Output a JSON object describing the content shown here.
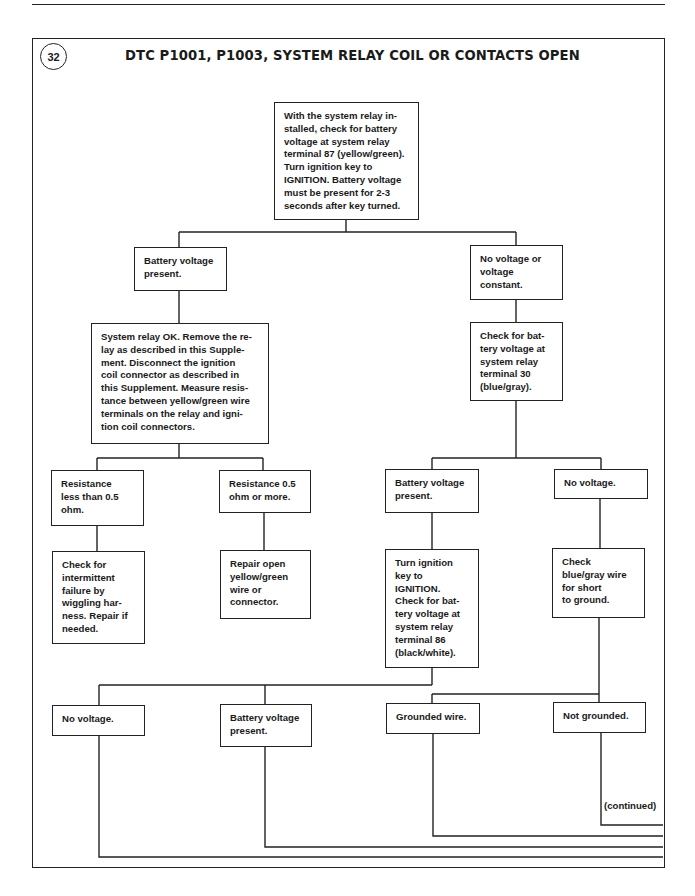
{
  "page": {
    "header_rule": true
  },
  "figure": {
    "number": "32",
    "title": "DTC P1001, P1003, SYSTEM RELAY COIL OR CONTACTS OPEN",
    "continued_label": "(continued)"
  },
  "flowchart": {
    "nodes": {
      "start": "With the system relay in-\nstalled, check for battery\nvoltage at system relay\nterminal 87 (yellow/green).\nTurn ignition key to\nIGNITION. Battery voltage\nmust be present for 2-3\nseconds after key turned.",
      "battery_present_1": "Battery voltage\npresent.",
      "no_voltage_or_constant": "No voltage or\nvoltage\nconstant.",
      "relay_ok_measure": "System relay OK. Remove the re-\nlay as described in this Supple-\nment. Disconnect the ignition\ncoil connector as described in\nthis Supplement. Measure resis-\ntance between yellow/green wire\nterminals on the relay and igni-\ntion coil connectors.",
      "check_terminal_30": "Check for bat-\ntery voltage at\nsystem relay\nterminal 30\n(blue/gray).",
      "resistance_low": "Resistance\nless than 0.5\nohm.",
      "resistance_high": "Resistance 0.5\nohm or more.",
      "battery_present_2": "Battery voltage\npresent.",
      "no_voltage_1": "No voltage.",
      "check_intermittent": "Check for\nintermittent\nfailure by\nwiggling har-\nness. Repair if\nneeded.",
      "repair_open_wire": "Repair open\nyellow/green\nwire or\nconnector.",
      "check_terminal_86": "Turn ignition\nkey to\nIGNITION.\nCheck for bat-\ntery voltage at\nsystem relay\nterminal 86\n(black/white).",
      "check_short_ground": "Check\nblue/gray wire\nfor short\nto ground.",
      "no_voltage_2": "No voltage.",
      "battery_present_3": "Battery voltage\npresent.",
      "grounded_wire": "Grounded wire.",
      "not_grounded": "Not grounded."
    },
    "edges": [
      [
        "start",
        "battery_present_1"
      ],
      [
        "start",
        "no_voltage_or_constant"
      ],
      [
        "battery_present_1",
        "relay_ok_measure"
      ],
      [
        "no_voltage_or_constant",
        "check_terminal_30"
      ],
      [
        "relay_ok_measure",
        "resistance_low"
      ],
      [
        "relay_ok_measure",
        "resistance_high"
      ],
      [
        "check_terminal_30",
        "battery_present_2"
      ],
      [
        "check_terminal_30",
        "no_voltage_1"
      ],
      [
        "resistance_low",
        "check_intermittent"
      ],
      [
        "resistance_high",
        "repair_open_wire"
      ],
      [
        "battery_present_2",
        "check_terminal_86"
      ],
      [
        "no_voltage_1",
        "check_short_ground"
      ],
      [
        "check_terminal_86",
        "no_voltage_2"
      ],
      [
        "check_terminal_86",
        "battery_present_3"
      ],
      [
        "check_short_ground",
        "grounded_wire"
      ],
      [
        "check_short_ground",
        "not_grounded"
      ],
      [
        "no_voltage_2",
        "continued"
      ],
      [
        "battery_present_3",
        "continued"
      ],
      [
        "grounded_wire",
        "continued"
      ],
      [
        "not_grounded",
        "continued"
      ]
    ]
  }
}
